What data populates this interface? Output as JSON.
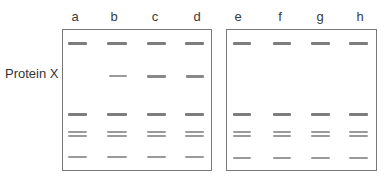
{
  "lanes": [
    {
      "label": "a",
      "x": 75
    },
    {
      "label": "b",
      "x": 114
    },
    {
      "label": "c",
      "x": 155
    },
    {
      "label": "d",
      "x": 197
    },
    {
      "label": "e",
      "x": 238
    },
    {
      "label": "f",
      "x": 280
    },
    {
      "label": "g",
      "x": 320
    },
    {
      "label": "h",
      "x": 360
    }
  ],
  "row_label": "Protein X",
  "panels": [
    {
      "name": "left",
      "lanes": [
        "a",
        "b",
        "c",
        "d"
      ]
    },
    {
      "name": "right",
      "lanes": [
        "e",
        "f",
        "g",
        "h"
      ]
    }
  ],
  "bands": {
    "top_marker": {
      "y": 42,
      "present_in": [
        "a",
        "b",
        "c",
        "d",
        "e",
        "f",
        "g",
        "h"
      ],
      "style": "thick"
    },
    "protein_x": {
      "y": 74,
      "present_in": [
        "b",
        "c",
        "d"
      ],
      "intensity": {
        "b": "thin",
        "c": "medium",
        "d": "medium"
      }
    },
    "mid_marker": {
      "y": 113,
      "present_in": [
        "a",
        "b",
        "c",
        "d",
        "e",
        "f",
        "g",
        "h"
      ],
      "style": "thick"
    },
    "doublet_upper": {
      "y": 131,
      "present_in": [
        "a",
        "b",
        "c",
        "d",
        "e",
        "f",
        "g",
        "h"
      ],
      "style": "thin"
    },
    "doublet_lower": {
      "y": 135,
      "present_in": [
        "a",
        "b",
        "c",
        "d",
        "e",
        "f",
        "g",
        "h"
      ],
      "style": "thin"
    },
    "bottom_marker": {
      "y": 156,
      "present_in": [
        "a",
        "b",
        "c",
        "d",
        "e",
        "f",
        "g",
        "h"
      ],
      "style": "thin"
    }
  }
}
